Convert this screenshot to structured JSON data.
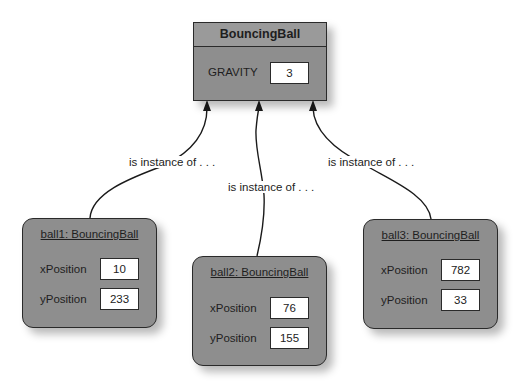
{
  "class": {
    "name": "BouncingBall",
    "fields": [
      {
        "label": "GRAVITY",
        "value": "3"
      }
    ]
  },
  "instances": [
    {
      "title": "ball1: BouncingBall",
      "fields": [
        {
          "label": "xPosition",
          "value": "10"
        },
        {
          "label": "yPosition",
          "value": "233"
        }
      ]
    },
    {
      "title": "ball2: BouncingBall",
      "fields": [
        {
          "label": "xPosition",
          "value": "76"
        },
        {
          "label": "yPosition",
          "value": "155"
        }
      ]
    },
    {
      "title": "ball3: BouncingBall",
      "fields": [
        {
          "label": "xPosition",
          "value": "782"
        },
        {
          "label": "yPosition",
          "value": "33"
        }
      ]
    }
  ],
  "edges": [
    {
      "label": "is instance of . . ."
    },
    {
      "label": "is instance of . . ."
    },
    {
      "label": "is instance of . . ."
    }
  ],
  "colors": {
    "box_fill": "#8e8e8e",
    "border": "#2a2a2a",
    "value_fill": "#ffffff",
    "background": "#ffffff"
  }
}
